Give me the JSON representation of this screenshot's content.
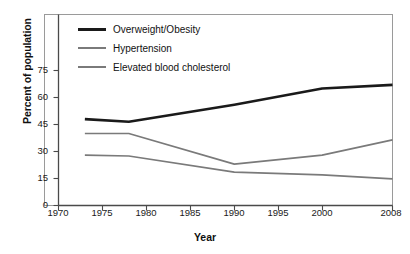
{
  "chart_data": {
    "type": "line",
    "title": "",
    "xlabel": "Year",
    "ylabel": "Percent of population",
    "xlim": [
      1970,
      2008
    ],
    "ylim": [
      0,
      82
    ],
    "grid": false,
    "legend_position": "top-left inside",
    "xticks": [
      "1970",
      "1975",
      "1980",
      "1985",
      "1990",
      "1995",
      "2000",
      "2008"
    ],
    "xtick_values": [
      1970,
      1975,
      1980,
      1985,
      1990,
      1995,
      2000,
      2008
    ],
    "yticks": [
      "0",
      "15",
      "30",
      "45",
      "60",
      "75"
    ],
    "ytick_values": [
      0,
      15,
      30,
      45,
      60,
      75
    ],
    "x": [
      1973,
      1978,
      1990,
      2000,
      2008
    ],
    "series": [
      {
        "name": "Overweight/Obesity",
        "color": "#1a1a1a",
        "width": 2.6,
        "values": [
          48,
          46.5,
          56,
          65,
          67
        ]
      },
      {
        "name": "Hypertension",
        "color": "#7a7a7a",
        "width": 1.7,
        "values": [
          40,
          40,
          23,
          28,
          36.5
        ]
      },
      {
        "name": "Elevated blood cholesterol",
        "color": "#7a7a7a",
        "width": 1.7,
        "values": [
          28,
          27.5,
          18.5,
          17,
          14.8
        ]
      }
    ]
  },
  "legend": {
    "items": [
      {
        "label": "Overweight/Obesity",
        "color": "#1a1a1a",
        "thickness": "3px"
      },
      {
        "label": "Hypertension",
        "color": "#7a7a7a",
        "thickness": "2px"
      },
      {
        "label": "Elevated blood cholesterol",
        "color": "#7a7a7a",
        "thickness": "2px"
      }
    ]
  },
  "axes": {
    "xlabel": "Year",
    "ylabel": "Percent of population",
    "xticks": [
      "1970",
      "1975",
      "1980",
      "1985",
      "1990",
      "1995",
      "2000",
      "2008"
    ],
    "yticks": [
      "75",
      "60",
      "45",
      "30",
      "15",
      "0"
    ]
  },
  "colors": {
    "frame": "#9a9a9a",
    "axis": "#555555",
    "series_dark": "#1a1a1a",
    "series_gray": "#7a7a7a",
    "background": "#ffffff"
  }
}
